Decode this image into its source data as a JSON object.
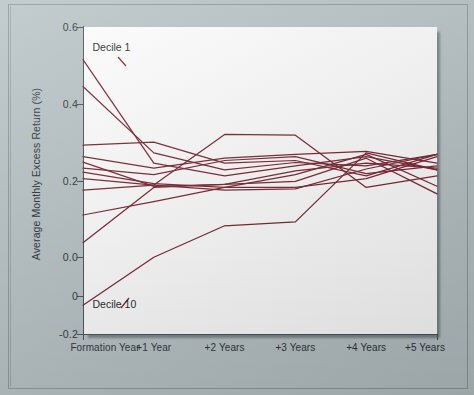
{
  "figure": {
    "background_color": "#b8c3c5",
    "plot_background_color": "#ffffff",
    "line_color": "#7a2230",
    "axis_color": "#4a5154",
    "text_color": "#2c3234"
  },
  "chart_data": {
    "type": "line",
    "title": "",
    "xlabel": "",
    "ylabel": "Average Monthly Excess Return (%)",
    "x": [
      0,
      1,
      2,
      3,
      4,
      5
    ],
    "categories": [
      "Formation Year",
      "+1 Year",
      "+2 Years",
      "+3 Years",
      "+4 Years",
      "+5 Years"
    ],
    "xtick_labels": [
      "Formation Year",
      "+1 Year",
      "+2 Years",
      "+3 Years",
      "+4 Years",
      "+5 Years"
    ],
    "ytick_labels": [
      "0.6",
      "0.4",
      "0.2",
      "0.0",
      "0",
      "-0.2"
    ],
    "ytick_values": [
      0.6,
      0.4,
      0.2,
      0.0,
      -0.1,
      -0.2
    ],
    "ylim": [
      -0.2,
      0.6
    ],
    "xlim": [
      0,
      5
    ],
    "grid": false,
    "legend": "none",
    "annotations": [
      {
        "text": "Decile 1",
        "x": 0.05,
        "y": 0.545,
        "anchor": "start"
      },
      {
        "text": "Decile 10",
        "x": 0.05,
        "y": -0.125,
        "anchor": "start"
      }
    ],
    "series": [
      {
        "name": "Decile 1",
        "values": [
          0.515,
          0.245,
          0.212,
          0.238,
          0.262,
          0.228
        ]
      },
      {
        "name": "Decile 2",
        "values": [
          0.445,
          0.272,
          0.228,
          0.247,
          0.238,
          0.268
        ]
      },
      {
        "name": "Decile 3",
        "values": [
          0.292,
          0.3,
          0.245,
          0.252,
          0.212,
          0.268
        ]
      },
      {
        "name": "Decile 4",
        "values": [
          0.262,
          0.232,
          0.258,
          0.268,
          0.276,
          0.245
        ]
      },
      {
        "name": "Decile 5",
        "values": [
          0.248,
          0.185,
          0.19,
          0.225,
          0.245,
          0.232
        ]
      },
      {
        "name": "Decile 6",
        "values": [
          0.232,
          0.215,
          0.252,
          0.262,
          0.218,
          0.238
        ]
      },
      {
        "name": "Decile 7",
        "values": [
          0.222,
          0.192,
          0.182,
          0.182,
          0.205,
          0.262
        ]
      },
      {
        "name": "Decile 8",
        "values": [
          0.205,
          0.188,
          0.175,
          0.178,
          0.23,
          0.268
        ]
      },
      {
        "name": "Decile 9",
        "values": [
          0.175,
          0.188,
          0.32,
          0.318,
          0.182,
          0.212
        ]
      },
      {
        "name": "Decile 10",
        "values": [
          0.11,
          0.145,
          0.182,
          0.215,
          0.268,
          0.185
        ]
      },
      {
        "name": "Decile 11",
        "values": [
          0.038,
          0.182,
          0.19,
          0.198,
          0.258,
          0.165
        ]
      },
      {
        "name": "Decile 12",
        "values": [
          -0.125,
          0.0,
          0.082,
          0.092,
          0.272,
          0.228
        ]
      }
    ]
  }
}
